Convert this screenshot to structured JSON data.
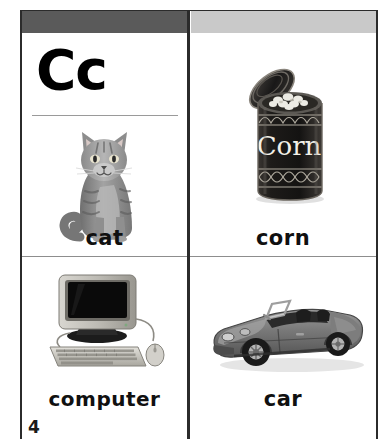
{
  "page": {
    "letter_heading": "Cc",
    "page_number": "4",
    "header_left_color": "#5a5a5a",
    "header_right_color": "#c9c9c9",
    "divider_color": "#2b2b2b"
  },
  "cells": [
    {
      "id": "cat",
      "word": "cat",
      "image_name": "cat-photo",
      "image_alt": "gray tabby cat sitting facing forward"
    },
    {
      "id": "corn",
      "word": "corn",
      "image_name": "corn-can-photo",
      "image_alt": "opened dark can of corn with lid tilted and kernels visible",
      "can_label": "Corn"
    },
    {
      "id": "computer",
      "word": "computer",
      "image_name": "computer-photo",
      "image_alt": "CRT monitor with keyboard and mouse"
    },
    {
      "id": "car",
      "word": "car",
      "image_name": "car-photo",
      "image_alt": "gray convertible sports car front three-quarter view"
    }
  ]
}
